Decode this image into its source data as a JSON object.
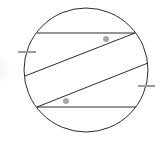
{
  "diagram": {
    "colors": {
      "stroke": "#2b2b2b",
      "tick": "#9a9a9a",
      "angle_marker": "#a8a8a8",
      "background": "#ffffff"
    },
    "elements": [
      {
        "id": "circle",
        "kind": "circle"
      },
      {
        "id": "chord-top",
        "kind": "horizontal chord"
      },
      {
        "id": "chord-upper-slanted",
        "kind": "slanted chord"
      },
      {
        "id": "chord-lower-slanted",
        "kind": "slanted chord, parallel to upper"
      },
      {
        "id": "chord-bottom",
        "kind": "horizontal chord"
      },
      {
        "id": "angle-marker-top",
        "kind": "dot angle marker"
      },
      {
        "id": "angle-marker-bottom",
        "kind": "dot angle marker"
      },
      {
        "id": "arc-tick-left",
        "kind": "equal-arc tick"
      },
      {
        "id": "arc-tick-right",
        "kind": "equal-arc tick"
      }
    ]
  }
}
